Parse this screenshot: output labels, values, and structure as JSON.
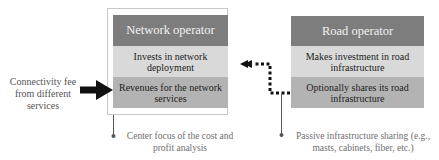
{
  "network_operator": {
    "title": "Network operator",
    "item1": "Invests in network deployment",
    "item2": "Revenues for the network services",
    "annotation": "Center focus of the cost and profit analysis"
  },
  "road_operator": {
    "title": "Road operator",
    "item1": "Makes investment in road infrastructure",
    "item2": "Optionally shares its road infrastructure",
    "annotation": "Passive infrastructure sharing (e.g., masts, cabinets, fiber, etc.)"
  },
  "input_flow": {
    "label": "Connectivity fee from different services"
  },
  "colors": {
    "header": "#7d7d7d",
    "row_light": "#d9d9d9",
    "row_dark": "#b3b3b3",
    "arrow": "#111111"
  }
}
